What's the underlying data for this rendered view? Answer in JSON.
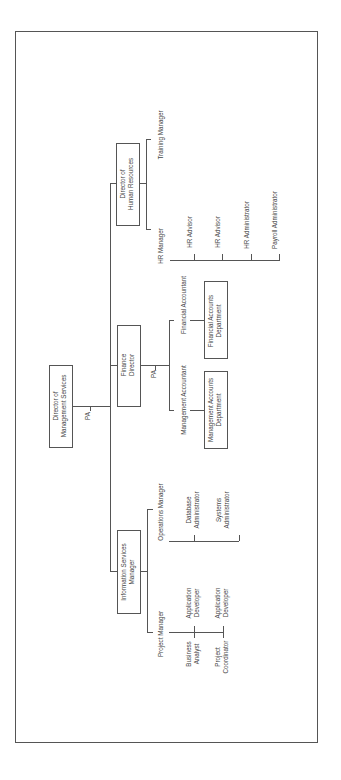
{
  "chart": {
    "orientation": "rotated -90deg (landscape page)",
    "root": {
      "label": "Director of\nManagement Services",
      "line1": "Director of",
      "line2": "Management Services",
      "assistant": "PA"
    },
    "directors": [
      {
        "id": "hr",
        "line1": "Director of",
        "line2": "Human Resources",
        "reports": [
          "Training Manager",
          "HR Manager"
        ],
        "hr_manager_reports": [
          "HR Advisor",
          "HR Advisor",
          "HR Administrator",
          "Payroll Administrator"
        ]
      },
      {
        "id": "finance",
        "line1": "Finance",
        "line2": "Director",
        "assistant": "PA",
        "reports": [
          {
            "label": "Financial Accountant",
            "dept_line1": "Financial Accounts",
            "dept_line2": "Department"
          },
          {
            "label": "Management Accountant",
            "dept_line1": "Management Accounts",
            "dept_line2": "Department"
          }
        ]
      },
      {
        "id": "is",
        "line1": "Information Services",
        "line2": "Manager",
        "reports": [
          {
            "label": "Operations Manager",
            "children": [
              {
                "line1": "Database",
                "line2": "Administrator"
              },
              {
                "line1": "Systems",
                "line2": "Administrator"
              }
            ]
          },
          {
            "label": "Project Manager",
            "children_right": [
              {
                "line1": "Application",
                "line2": "Developer"
              },
              {
                "line1": "Application",
                "line2": "Developer"
              }
            ],
            "children_left": [
              {
                "line1": "Business",
                "line2": "Analyst"
              },
              {
                "line1": "Project",
                "line2": "Coordinator"
              }
            ]
          }
        ]
      }
    ]
  }
}
